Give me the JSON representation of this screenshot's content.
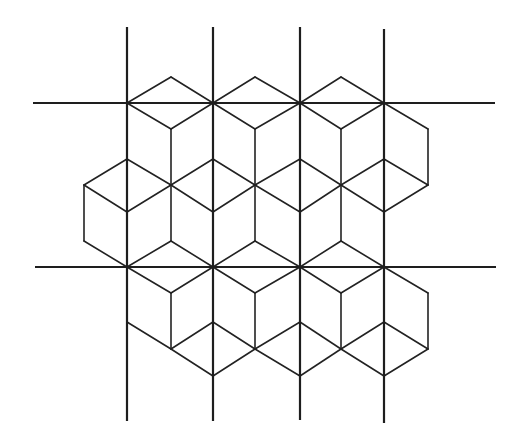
{
  "diagram": {
    "canvas": {
      "width": 521,
      "height": 448,
      "background": "#ffffff"
    },
    "colors": {
      "grid": "#1e1e1e",
      "tiles": "#222222"
    },
    "grid_lines": {
      "vertical": [
        {
          "x": 127,
          "y1": 27,
          "y2": 421
        },
        {
          "x": 213,
          "y1": 27,
          "y2": 421
        },
        {
          "x": 300,
          "y1": 27,
          "y2": 420
        },
        {
          "x": 384,
          "y1": 29,
          "y2": 423
        }
      ],
      "horizontal": [
        {
          "y": 103,
          "x1": 33,
          "x2": 495
        },
        {
          "y": 267,
          "x1": 35,
          "x2": 496
        }
      ]
    },
    "tile_segments": [
      [
        127,
        103,
        171,
        77
      ],
      [
        171,
        77,
        213,
        103
      ],
      [
        213,
        103,
        255,
        77
      ],
      [
        255,
        77,
        300,
        103
      ],
      [
        300,
        103,
        341,
        77
      ],
      [
        341,
        77,
        384,
        103
      ],
      [
        127,
        103,
        171,
        129
      ],
      [
        171,
        129,
        213,
        103
      ],
      [
        213,
        103,
        255,
        129
      ],
      [
        255,
        129,
        300,
        103
      ],
      [
        300,
        103,
        341,
        129
      ],
      [
        341,
        129,
        384,
        103
      ],
      [
        384,
        103,
        428,
        129
      ],
      [
        428,
        129,
        428,
        185
      ],
      [
        171,
        129,
        171,
        185
      ],
      [
        255,
        129,
        255,
        185
      ],
      [
        341,
        129,
        341,
        185
      ],
      [
        84,
        185,
        127,
        159
      ],
      [
        127,
        159,
        171,
        185
      ],
      [
        171,
        185,
        213,
        159
      ],
      [
        213,
        159,
        255,
        185
      ],
      [
        255,
        185,
        300,
        159
      ],
      [
        300,
        159,
        341,
        185
      ],
      [
        341,
        185,
        384,
        159
      ],
      [
        384,
        159,
        428,
        185
      ],
      [
        84,
        185,
        127,
        212
      ],
      [
        127,
        212,
        171,
        185
      ],
      [
        171,
        185,
        213,
        212
      ],
      [
        213,
        212,
        255,
        185
      ],
      [
        255,
        185,
        300,
        212
      ],
      [
        300,
        212,
        341,
        185
      ],
      [
        341,
        185,
        384,
        212
      ],
      [
        384,
        212,
        428,
        185
      ],
      [
        84,
        185,
        84,
        241
      ],
      [
        84,
        241,
        127,
        267
      ],
      [
        171,
        185,
        171,
        241
      ],
      [
        255,
        185,
        255,
        241
      ],
      [
        341,
        185,
        341,
        241
      ],
      [
        127,
        267,
        171,
        241
      ],
      [
        171,
        241,
        213,
        267
      ],
      [
        213,
        267,
        255,
        241
      ],
      [
        255,
        241,
        300,
        267
      ],
      [
        300,
        267,
        341,
        241
      ],
      [
        341,
        241,
        384,
        267
      ],
      [
        127,
        267,
        171,
        293
      ],
      [
        171,
        293,
        213,
        267
      ],
      [
        213,
        267,
        255,
        293
      ],
      [
        255,
        293,
        300,
        267
      ],
      [
        300,
        267,
        341,
        293
      ],
      [
        341,
        293,
        384,
        267
      ],
      [
        384,
        267,
        428,
        293
      ],
      [
        428,
        293,
        428,
        349
      ],
      [
        171,
        293,
        171,
        349
      ],
      [
        255,
        293,
        255,
        349
      ],
      [
        341,
        293,
        341,
        349
      ],
      [
        127,
        322,
        171,
        349
      ],
      [
        171,
        349,
        213,
        322
      ],
      [
        213,
        322,
        255,
        349
      ],
      [
        255,
        349,
        300,
        322
      ],
      [
        300,
        322,
        341,
        349
      ],
      [
        341,
        349,
        384,
        322
      ],
      [
        384,
        322,
        428,
        349
      ],
      [
        171,
        349,
        213,
        376
      ],
      [
        213,
        376,
        255,
        349
      ],
      [
        255,
        349,
        300,
        376
      ],
      [
        300,
        376,
        341,
        349
      ],
      [
        341,
        349,
        384,
        376
      ],
      [
        384,
        376,
        428,
        349
      ]
    ]
  }
}
